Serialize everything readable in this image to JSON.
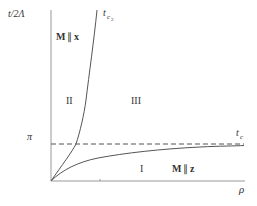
{
  "diagram": {
    "type": "phase-diagram",
    "y_axis_label": "t/2Λ",
    "x_axis_label": "ρ",
    "y_tick_label": "π",
    "curves": [
      {
        "name": "t_c2",
        "label": "t",
        "subscript": "c",
        "subsubscript": "2"
      },
      {
        "name": "t_c",
        "label": "t",
        "subscript": "c"
      }
    ],
    "regions": [
      {
        "id": "I",
        "label": "I",
        "annotation": "M ∥ z"
      },
      {
        "id": "II",
        "label": "II",
        "annotation": "M ∥ x"
      },
      {
        "id": "III",
        "label": "III"
      }
    ],
    "reference_line": {
      "value": "π",
      "style": "dashed"
    },
    "colors": {
      "axis": "#888888",
      "curve": "#555555",
      "text": "#333333"
    }
  },
  "labels": {
    "y_axis": "t/2Λ",
    "x_axis": "ρ",
    "pi": "π",
    "tc2_main": "t",
    "tc2_sub": "c",
    "tc2_subsub": "2",
    "tc_main": "t",
    "tc_sub": "c",
    "region_I": "I",
    "region_II": "II",
    "region_III": "III",
    "m_x_M": "M",
    "m_x_par": "∥",
    "m_x_x": "x",
    "m_z_M": "M",
    "m_z_par": "∥",
    "m_z_z": "z"
  }
}
